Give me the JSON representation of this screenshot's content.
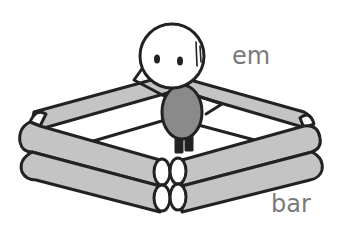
{
  "labels": {
    "figure": "em",
    "enclosure": "bar"
  },
  "colors": {
    "outline": "#222222",
    "log_fill": "#c4c4c4",
    "log_end_fill": "#ffffff",
    "body_fill": "#8a8a8a",
    "head_fill": "#ffffff",
    "label_text": "#7a7a7a",
    "background": "#ffffff"
  },
  "illustration": {
    "figure": {
      "parts": [
        "head",
        "eyes",
        "blush-marks",
        "raised-arm",
        "arm-on-hip",
        "body",
        "legs"
      ]
    },
    "enclosure": {
      "shape": "square log frame",
      "log_layers": 2
    }
  }
}
